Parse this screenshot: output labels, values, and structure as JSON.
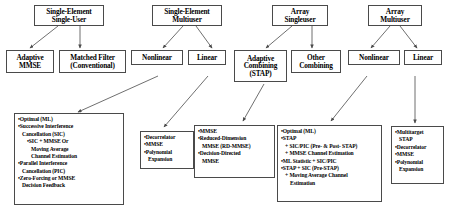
{
  "diagram": {
    "line_color": "#4a4a4a",
    "box_fill": "#ffffff",
    "text_color": "#000000",
    "roots": [
      {
        "id": "root-single-element-single-user",
        "lines": [
          "Single-Element",
          "Single-User"
        ]
      },
      {
        "id": "root-single-element-multiuser",
        "lines": [
          "Single-Element",
          "Multiuser"
        ]
      },
      {
        "id": "root-array-singleuser",
        "lines": [
          "Array",
          "Singleuser"
        ]
      },
      {
        "id": "root-array-multiuser",
        "lines": [
          "Array",
          "Multiuser"
        ]
      }
    ],
    "mids": [
      {
        "id": "mid-adaptive-mmse",
        "lines": [
          "Adaptive",
          "MMSE"
        ]
      },
      {
        "id": "mid-matched-filter",
        "lines": [
          "Matched Filter",
          "(Conventional)"
        ]
      },
      {
        "id": "mid-nonlinear-sem",
        "lines": [
          "Nonlinear"
        ]
      },
      {
        "id": "mid-linear-sem",
        "lines": [
          "Linear"
        ]
      },
      {
        "id": "mid-adaptive-combining",
        "lines": [
          "Adaptive",
          "Combining",
          "(STAP)"
        ]
      },
      {
        "id": "mid-other-combining",
        "lines": [
          "Other",
          "Combining"
        ]
      },
      {
        "id": "mid-nonlinear-am",
        "lines": [
          "Nonlinear"
        ]
      },
      {
        "id": "mid-linear-am",
        "lines": [
          "Linear"
        ]
      }
    ],
    "details": [
      {
        "id": "detail-single-element-multiuser-nonlinear",
        "lines": [
          {
            "text": "•Optimal (ML)",
            "indent": 0
          },
          {
            "text": "•Successive Interference",
            "indent": 0
          },
          {
            "text": "Cancellation (SIC)",
            "indent": 1
          },
          {
            "text": "•SIC + MMSE Or",
            "indent": 2
          },
          {
            "text": "Moving Average",
            "indent": 3
          },
          {
            "text": "Channel Estimation",
            "indent": 3
          },
          {
            "text": "•Parallel Interference",
            "indent": 0
          },
          {
            "text": "Cancellation (PIC)",
            "indent": 1
          },
          {
            "text": "•Zero-Forcing or MMSE",
            "indent": 0
          },
          {
            "text": "Decision Feedback",
            "indent": 1
          }
        ]
      },
      {
        "id": "detail-single-element-multiuser-linear",
        "lines": [
          {
            "text": "•Decorrelator",
            "indent": 0
          },
          {
            "text": "•MMSE",
            "indent": 0
          },
          {
            "text": "•Polynomial",
            "indent": 0
          },
          {
            "text": "Expansion",
            "indent": 1
          }
        ]
      },
      {
        "id": "detail-adaptive-combining-stap",
        "lines": [
          {
            "text": "•MMSE",
            "indent": 0
          },
          {
            "text": "•Reduced-Dimension",
            "indent": 0
          },
          {
            "text": "MMSE (RD-MMSE)",
            "indent": 1
          },
          {
            "text": "•Decision-Directed",
            "indent": 0
          },
          {
            "text": "MMSE",
            "indent": 1
          }
        ]
      },
      {
        "id": "detail-array-multiuser-nonlinear",
        "lines": [
          {
            "text": "•Optimal (ML)",
            "indent": 0
          },
          {
            "text": "•STAP",
            "indent": 0
          },
          {
            "text": "+ SIC/PIC  (Pre- & Post- STAP)",
            "indent": 1
          },
          {
            "text": "+ MMSE Channel Estimation",
            "indent": 1
          },
          {
            "text": "•ML Statistic + SIC/PIC",
            "indent": 0
          },
          {
            "text": "•STAP + SIC  (Pre-STAP)",
            "indent": 0
          },
          {
            "text": "+ Moving Average Channel",
            "indent": 1
          },
          {
            "text": "Estimation",
            "indent": 2
          }
        ]
      },
      {
        "id": "detail-array-multiuser-linear",
        "lines": [
          {
            "text": "•Multitarget",
            "indent": 0
          },
          {
            "text": "STAP",
            "indent": 1
          },
          {
            "text": "•Decorrelator",
            "indent": 0
          },
          {
            "text": "•MMSE",
            "indent": 0
          },
          {
            "text": "•Polynomial",
            "indent": 0
          },
          {
            "text": "Expansion",
            "indent": 1
          }
        ]
      }
    ]
  }
}
